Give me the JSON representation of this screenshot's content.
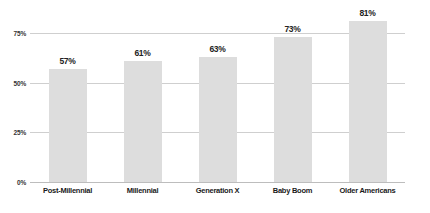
{
  "chart_data": {
    "type": "bar",
    "title": "",
    "subtitle": "",
    "xlabel": "",
    "ylabel": "",
    "categories": [
      "Post-Millennial",
      "Millennial",
      "Generation X",
      "Baby Boom",
      "Older Americans"
    ],
    "values": [
      57,
      61,
      63,
      73,
      81
    ],
    "value_labels": [
      "57%",
      "61%",
      "63%",
      "73%",
      "81%"
    ],
    "ylim": [
      0,
      87.5
    ],
    "yticks": [
      0,
      25,
      50,
      75
    ],
    "ytick_labels": [
      "0%",
      "25%",
      "50%",
      "75%"
    ],
    "grid": true,
    "legend": false,
    "legend_position": "none",
    "bar_color": "#dddddd",
    "gridline_color": "#cfcfcf",
    "baseline_color": "#bdbdbd",
    "value_label_color": "#222222",
    "category_label_color": "#1a1a1a",
    "tick_label_color": "#333333",
    "background_color": "#ffffff"
  }
}
